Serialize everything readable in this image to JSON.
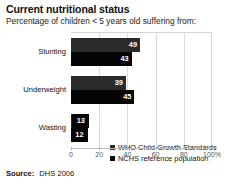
{
  "header": {
    "title": "Current nutritional status",
    "subtitle": "Percentage of children < 5 years old suffering from:"
  },
  "footer": {
    "label": "Source:",
    "value": "DHS 2006"
  },
  "chart_data": {
    "type": "bar",
    "orientation": "horizontal",
    "title": "Current nutritional status",
    "subtitle": "Percentage of children < 5 years old suffering from:",
    "categories": [
      "Stunting",
      "Underweight",
      "Wasting"
    ],
    "series": [
      {
        "name": "WHO Child Growth Standards",
        "values": [
          49,
          39,
          13
        ],
        "color": "#2b2b2b"
      },
      {
        "name": "NCHS reference population",
        "values": [
          43,
          45,
          12
        ],
        "color": "#050505"
      }
    ],
    "xlabel": "",
    "ylabel": "",
    "xlim": [
      0,
      100
    ],
    "xticks": [
      0,
      20,
      40,
      60,
      80,
      100
    ],
    "xtick_labels": [
      "0",
      "20",
      "40",
      "60",
      "80",
      "100%"
    ],
    "grid": true,
    "legend_position": "inside-bottom-right",
    "value_labels": true
  }
}
